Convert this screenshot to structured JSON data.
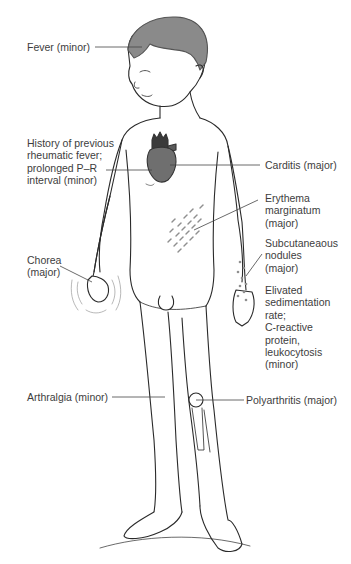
{
  "figure": {
    "colors": {
      "outline": "#2a2a2a",
      "hair": "#8a8a8a",
      "heart": "#6f6f6f",
      "heart_vessels": "#3a3a3a",
      "rash": "#8f8f8f",
      "text": "#3d3d3d",
      "leader_line": "#444444"
    }
  },
  "labels": {
    "fever": {
      "lines": [
        "Fever (minor)"
      ]
    },
    "history": {
      "lines": [
        "History of previous",
        "rheumatic fever;",
        "prolonged P–R",
        "interval (minor)"
      ]
    },
    "carditis": {
      "lines": [
        "Carditis (major)"
      ]
    },
    "erythema": {
      "lines": [
        "Erythema",
        "marginatum",
        "(major)"
      ]
    },
    "subcutaneous": {
      "lines": [
        "Subcutaneaous",
        "nodules",
        "(major)"
      ]
    },
    "chorea": {
      "lines": [
        "Chorea",
        "(major)"
      ]
    },
    "elevated": {
      "lines": [
        "Elivated",
        "sedimentation",
        "rate;",
        "C-reactive",
        "protein,",
        "leukocytosis",
        "(minor)"
      ]
    },
    "arthralgia": {
      "lines": [
        "Arthralgia (minor)"
      ]
    },
    "polyarthritis": {
      "lines": [
        "Polyarthritis (major)"
      ]
    }
  }
}
